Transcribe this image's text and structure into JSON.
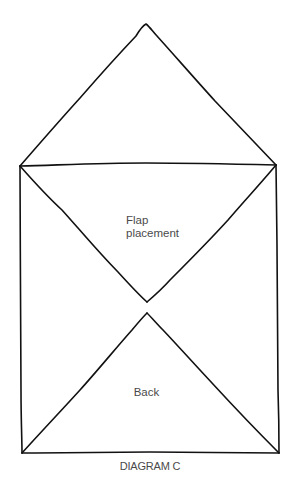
{
  "diagram": {
    "caption": "DIAGRAM C",
    "labels": {
      "flap_line1": "Flap",
      "flap_line2": "placement",
      "back": "Back"
    },
    "stroke_color": "#111111",
    "text_color": "#4a4a4a",
    "shapes": {
      "top_flap_triangle": [
        [
          20,
          166
        ],
        [
          146,
          24
        ],
        [
          276,
          165
        ]
      ],
      "envelope_rectangle": [
        [
          20,
          166
        ],
        [
          276,
          165
        ],
        [
          279,
          453
        ],
        [
          22,
          453
        ]
      ],
      "flap_placement_triangle": [
        [
          20,
          166
        ],
        [
          276,
          165
        ],
        [
          147,
          302
        ]
      ],
      "back_triangle": [
        [
          22,
          453
        ],
        [
          147,
          313
        ],
        [
          279,
          453
        ]
      ]
    }
  }
}
